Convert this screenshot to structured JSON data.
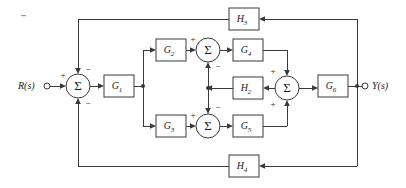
{
  "figure": {
    "type": "control-system-block-diagram",
    "title": "",
    "width": 406,
    "height": 188,
    "background_color": "#ffffff",
    "line_color": "#3a3a3a",
    "text_color": "#1a1a1a"
  },
  "io": {
    "input_label": "R(s)",
    "output_label": "Y(s)"
  },
  "blocks": [
    {
      "id": "G1",
      "label": "G",
      "sub": "1",
      "x": 104,
      "y": 75,
      "w": 30,
      "h": 22
    },
    {
      "id": "G2",
      "label": "G",
      "sub": "2",
      "x": 156,
      "y": 39,
      "w": 30,
      "h": 22
    },
    {
      "id": "G3",
      "label": "G",
      "sub": "3",
      "x": 156,
      "y": 115,
      "w": 30,
      "h": 22
    },
    {
      "id": "G4",
      "label": "G",
      "sub": "4",
      "x": 233,
      "y": 39,
      "w": 30,
      "h": 22
    },
    {
      "id": "G5",
      "label": "G",
      "sub": "5",
      "x": 233,
      "y": 115,
      "w": 30,
      "h": 22
    },
    {
      "id": "G6",
      "label": "G",
      "sub": "6",
      "x": 318,
      "y": 75,
      "w": 30,
      "h": 22
    },
    {
      "id": "H2",
      "label": "H",
      "sub": "2",
      "x": 233,
      "y": 77,
      "w": 30,
      "h": 22
    },
    {
      "id": "H3",
      "label": "H",
      "sub": "3",
      "x": 229,
      "y": 8,
      "w": 30,
      "h": 22
    },
    {
      "id": "H4",
      "label": "H",
      "sub": "4",
      "x": 229,
      "y": 155,
      "w": 30,
      "h": 22
    }
  ],
  "summing_junctions": [
    {
      "id": "S1",
      "cx": 78,
      "cy": 86,
      "r": 12,
      "signs": [
        {
          "text": "+",
          "x": 63,
          "y": 76
        },
        {
          "text": "−",
          "x": 88,
          "y": 70
        },
        {
          "text": "−",
          "x": 88,
          "y": 104
        }
      ]
    },
    {
      "id": "S2",
      "cx": 208,
      "cy": 50,
      "r": 12,
      "signs": [
        {
          "text": "+",
          "x": 193,
          "y": 40
        },
        {
          "text": "−",
          "x": 218,
          "y": 67
        }
      ]
    },
    {
      "id": "S3",
      "cx": 208,
      "cy": 126,
      "r": 12,
      "signs": [
        {
          "text": "+",
          "x": 193,
          "y": 116
        },
        {
          "text": "−",
          "x": 218,
          "y": 108
        }
      ]
    },
    {
      "id": "S4",
      "cx": 287,
      "cy": 88,
      "r": 12,
      "signs": [
        {
          "text": "+",
          "x": 273,
          "y": 72
        },
        {
          "text": "+",
          "x": 273,
          "y": 105
        }
      ]
    }
  ],
  "terminals": [
    {
      "id": "input-terminal",
      "cx": 47,
      "cy": 86,
      "r": 3
    },
    {
      "id": "output-terminal",
      "cx": 365,
      "cy": 86,
      "r": 3
    }
  ],
  "junction_dots": [
    {
      "id": "g1-branch",
      "cx": 143,
      "cy": 86
    },
    {
      "id": "h2-split",
      "cx": 208,
      "cy": 88
    },
    {
      "id": "output-tap",
      "cx": 357,
      "cy": 86
    }
  ],
  "signals": {
    "plus": "+",
    "minus": "−"
  }
}
